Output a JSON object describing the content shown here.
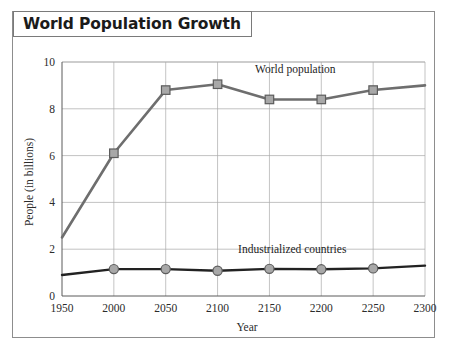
{
  "figure": {
    "title": "World Population Growth",
    "frame_color": "#8d8d8d",
    "background": "#ffffff"
  },
  "chart_data": {
    "type": "line",
    "title": "World Population Growth",
    "xlabel": "Year",
    "ylabel": "People (in billions)",
    "x": [
      1950,
      2000,
      2050,
      2100,
      2150,
      2200,
      2250,
      2300
    ],
    "categories": [
      "1950",
      "2000",
      "2050",
      "2100",
      "2150",
      "2200",
      "2250",
      "2300"
    ],
    "xlim": [
      1950,
      2300
    ],
    "ylim": [
      0,
      10
    ],
    "xticks": [
      1950,
      2000,
      2050,
      2100,
      2150,
      2200,
      2250,
      2300
    ],
    "yticks": [
      0,
      2,
      4,
      6,
      8,
      10
    ],
    "grid": true,
    "legend_position": "inline-annotations",
    "series": [
      {
        "name": "World population",
        "values": [
          2.5,
          6.1,
          8.8,
          9.05,
          8.4,
          8.4,
          8.8,
          9.0
        ],
        "marker": "square",
        "marker_fill": "#a8a8a8",
        "marker_stroke": "#5c5c5c",
        "line_color": "#6e6e6e",
        "line_width": 2.6,
        "label_x": 2175,
        "label_y": 9.55
      },
      {
        "name": "Industrialized countries",
        "values": [
          0.9,
          1.15,
          1.15,
          1.08,
          1.16,
          1.14,
          1.18,
          1.3
        ],
        "marker": "circle",
        "marker_fill": "#a8a8a8",
        "marker_stroke": "#5c5c5c",
        "line_color": "#222222",
        "line_width": 2.4,
        "label_x": 2172,
        "label_y": 1.85
      }
    ]
  },
  "annotations": {
    "world_population_label": "World population",
    "industrialized_label": "Industrialized countries"
  },
  "axis": {
    "x_title": "Year",
    "y_title": "People (in billions)"
  }
}
